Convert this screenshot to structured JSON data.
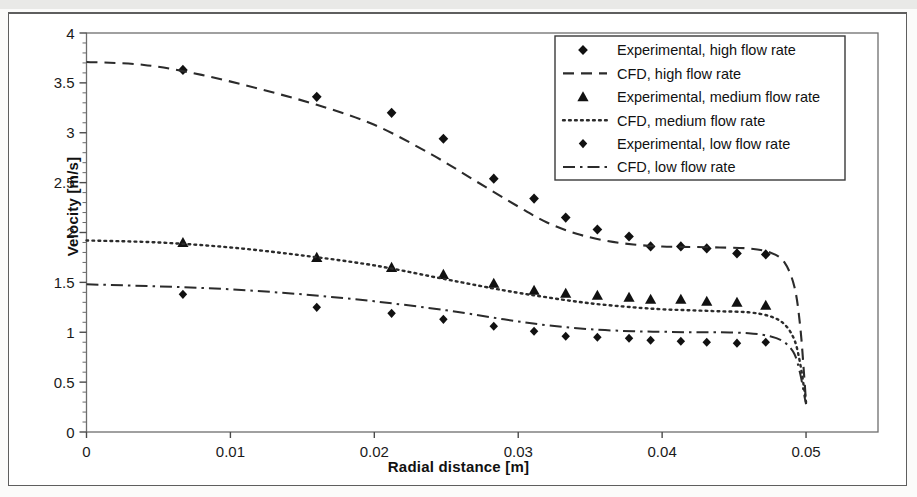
{
  "figure": {
    "background": "#ffffff",
    "frame_color": "#5e5e5e"
  },
  "axis": {
    "x_label": "Radial distance [m]",
    "y_label": "Velocity [m/s]",
    "x_ticks": [
      "0",
      "0.01",
      "0.02",
      "0.03",
      "0.04",
      "0.05"
    ],
    "x_tick_values": [
      0,
      0.01,
      0.02,
      0.03,
      0.04,
      0.05
    ],
    "y_ticks": [
      "0",
      "0.5",
      "1",
      "1.5",
      "2",
      "2.5",
      "3",
      "3.5",
      "4"
    ],
    "y_tick_values": [
      0,
      0.5,
      1,
      1.5,
      2,
      2.5,
      3,
      3.5,
      4
    ]
  },
  "legend": {
    "position": "top-right-inside",
    "entries": [
      {
        "label": "Experimental, high flow rate",
        "kind": "marker",
        "marker": "diamond"
      },
      {
        "label": "CFD, high flow rate",
        "kind": "line",
        "dash": "dashed"
      },
      {
        "label": "Experimental, medium flow rate",
        "kind": "marker",
        "marker": "triangle"
      },
      {
        "label": "CFD, medium flow rate",
        "kind": "line",
        "dash": "dotted"
      },
      {
        "label": "Experimental, low flow rate",
        "kind": "marker",
        "marker": "diamond-small"
      },
      {
        "label": "CFD, low flow rate",
        "kind": "line",
        "dash": "dashdot"
      }
    ]
  },
  "chart_data": {
    "type": "line",
    "title": "",
    "xlabel": "Radial distance [m]",
    "ylabel": "Velocity [m/s]",
    "xlim": [
      0,
      0.055
    ],
    "ylim": [
      0,
      4
    ],
    "grid": false,
    "legend_position": "upper right",
    "line_color": "#2b2b2b",
    "marker_color": "#111111",
    "series": [
      {
        "name": "Experimental, high flow rate",
        "type": "scatter",
        "marker": "diamond",
        "x": [
          0.0067,
          0.016,
          0.0212,
          0.0248,
          0.0283,
          0.0311,
          0.0333,
          0.0355,
          0.0377,
          0.0392,
          0.0413,
          0.0431,
          0.0452,
          0.0472
        ],
        "y": [
          3.63,
          3.36,
          3.2,
          2.94,
          2.54,
          2.34,
          2.15,
          2.03,
          1.96,
          1.86,
          1.86,
          1.84,
          1.79,
          1.78
        ]
      },
      {
        "name": "CFD, high flow rate",
        "type": "line",
        "dash": "dashed",
        "x": [
          0.0,
          0.004,
          0.008,
          0.012,
          0.016,
          0.02,
          0.024,
          0.027,
          0.03,
          0.032,
          0.034,
          0.036,
          0.038,
          0.04,
          0.042,
          0.044,
          0.046,
          0.0475,
          0.0485,
          0.0492,
          0.0496,
          0.0499,
          0.05
        ],
        "y": [
          3.71,
          3.68,
          3.58,
          3.44,
          3.28,
          3.08,
          2.78,
          2.52,
          2.26,
          2.1,
          1.99,
          1.92,
          1.88,
          1.86,
          1.855,
          1.85,
          1.84,
          1.8,
          1.7,
          1.45,
          1.05,
          0.5,
          0.28
        ]
      },
      {
        "name": "Experimental, medium flow rate",
        "type": "scatter",
        "marker": "triangle",
        "x": [
          0.0067,
          0.016,
          0.0212,
          0.0248,
          0.0283,
          0.0311,
          0.0333,
          0.0355,
          0.0377,
          0.0392,
          0.0413,
          0.0431,
          0.0452,
          0.0472
        ],
        "y": [
          1.9,
          1.75,
          1.65,
          1.58,
          1.49,
          1.42,
          1.39,
          1.37,
          1.35,
          1.33,
          1.33,
          1.31,
          1.3,
          1.27
        ]
      },
      {
        "name": "CFD, medium flow rate",
        "type": "line",
        "dash": "dotted",
        "x": [
          0.0,
          0.005,
          0.01,
          0.015,
          0.02,
          0.025,
          0.029,
          0.032,
          0.035,
          0.038,
          0.04,
          0.042,
          0.044,
          0.046,
          0.0475,
          0.0485,
          0.0492,
          0.0496,
          0.0499,
          0.05
        ],
        "y": [
          1.92,
          1.9,
          1.85,
          1.77,
          1.67,
          1.53,
          1.42,
          1.35,
          1.29,
          1.25,
          1.23,
          1.22,
          1.21,
          1.2,
          1.16,
          1.08,
          0.92,
          0.68,
          0.4,
          0.3
        ]
      },
      {
        "name": "Experimental, low flow rate",
        "type": "scatter",
        "marker": "diamond-small",
        "x": [
          0.0067,
          0.016,
          0.0212,
          0.0248,
          0.0283,
          0.0311,
          0.0333,
          0.0355,
          0.0377,
          0.0392,
          0.0413,
          0.0431,
          0.0452,
          0.0472
        ],
        "y": [
          1.38,
          1.25,
          1.19,
          1.13,
          1.06,
          1.01,
          0.96,
          0.95,
          0.94,
          0.92,
          0.91,
          0.9,
          0.89,
          0.9
        ]
      },
      {
        "name": "CFD, low flow rate",
        "type": "line",
        "dash": "dashdot",
        "x": [
          0.0,
          0.005,
          0.01,
          0.015,
          0.02,
          0.025,
          0.029,
          0.032,
          0.035,
          0.038,
          0.04,
          0.042,
          0.044,
          0.046,
          0.0475,
          0.0485,
          0.0492,
          0.0496,
          0.0499,
          0.05
        ],
        "y": [
          1.48,
          1.46,
          1.43,
          1.38,
          1.31,
          1.22,
          1.13,
          1.07,
          1.03,
          1.01,
          1.005,
          1.0,
          1.0,
          0.99,
          0.96,
          0.9,
          0.78,
          0.58,
          0.35,
          0.28
        ]
      }
    ]
  }
}
